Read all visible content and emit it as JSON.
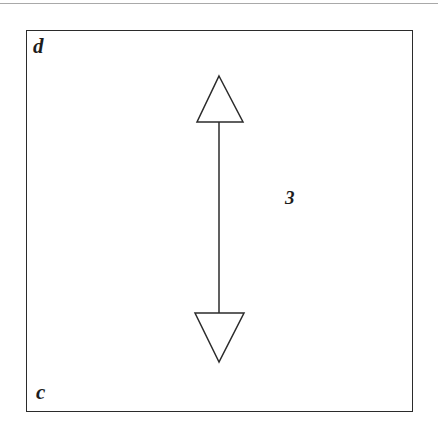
{
  "figure": {
    "background_color": "#ffffff",
    "ink_color": "#2b2b2b",
    "text_color": "#1d1d1d",
    "frame": {
      "name": "rectangle-outline",
      "x": 26,
      "y": 30,
      "width": 387,
      "height": 382
    },
    "page_rule": {
      "name": "page-top-rule",
      "y": 3
    },
    "vertex_labels": [
      {
        "id": "d",
        "label": "d",
        "position": "top-left",
        "x": 33,
        "y": 36
      },
      {
        "id": "c",
        "label": "c",
        "position": "bottom-left",
        "x": 36,
        "y": 382
      }
    ],
    "dimension": {
      "label": "3",
      "label_x": 285,
      "label_y": 188,
      "arrow": {
        "type": "double-headed-vertical",
        "filled": false,
        "shaft_x": 219,
        "shaft_top_y": 122,
        "shaft_bottom_y": 313,
        "head_up": {
          "apex_x": 219,
          "apex_y": 76,
          "base_left_x": 197,
          "base_right_x": 243,
          "base_y": 122
        },
        "head_down": {
          "apex_x": 219,
          "apex_y": 362,
          "base_left_x": 195,
          "base_right_x": 244,
          "base_y": 313
        }
      }
    }
  }
}
